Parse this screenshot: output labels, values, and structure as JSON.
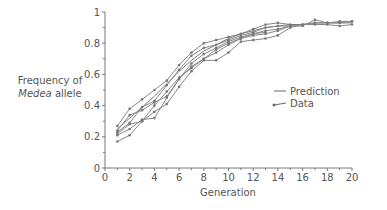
{
  "chart_data": {
    "type": "line",
    "title": "",
    "xlabel": "Generation",
    "ylabel": "Frequency of Medea allele",
    "ylabel_parts": {
      "line1": "Frequency of",
      "italic": "Medea",
      "rest": " allele"
    },
    "xlim": [
      0,
      20
    ],
    "ylim": [
      0,
      1
    ],
    "xticks": [
      0,
      2,
      4,
      6,
      8,
      10,
      12,
      14,
      16,
      18,
      20
    ],
    "yticks": [
      0,
      0.2,
      0.4,
      0.6,
      0.8,
      1
    ],
    "ytick_labels": [
      "0",
      "0.2",
      "0.4",
      "0.6",
      "0.8",
      "1"
    ],
    "grid": false,
    "legend": {
      "position": "right-middle",
      "entries": [
        {
          "label": "Prediction",
          "style": "line"
        },
        {
          "label": "Data",
          "style": "line-with-markers"
        }
      ]
    },
    "series": [
      {
        "name": "Prediction",
        "x": [
          1,
          2,
          3,
          4,
          5,
          6,
          7,
          8,
          9,
          10,
          11,
          12,
          13,
          14,
          15,
          16,
          17,
          18,
          19,
          20
        ],
        "values": [
          0.25,
          0.32,
          0.39,
          0.46,
          0.54,
          0.62,
          0.69,
          0.75,
          0.79,
          0.83,
          0.86,
          0.88,
          0.9,
          0.91,
          0.92,
          0.92,
          0.93,
          0.93,
          0.93,
          0.93
        ]
      },
      {
        "name": "Data 1",
        "x": [
          1,
          2,
          3,
          4,
          5,
          6,
          7,
          8,
          9,
          10,
          11,
          12,
          13,
          14,
          15
        ],
        "values": [
          0.27,
          0.38,
          0.44,
          0.5,
          0.56,
          0.66,
          0.74,
          0.8,
          0.82,
          0.84,
          0.86,
          0.89,
          0.92,
          0.93,
          0.92
        ]
      },
      {
        "name": "Data 2",
        "x": [
          1,
          2,
          3,
          4,
          5,
          6,
          7,
          8,
          9,
          10,
          11,
          12,
          13,
          14,
          15
        ],
        "values": [
          0.23,
          0.29,
          0.39,
          0.43,
          0.53,
          0.63,
          0.72,
          0.77,
          0.79,
          0.82,
          0.85,
          0.87,
          0.9,
          0.91,
          0.91
        ]
      },
      {
        "name": "Data 3",
        "x": [
          1,
          2,
          3,
          4,
          5,
          6,
          7,
          8,
          9,
          10,
          11,
          12,
          13,
          14,
          15,
          16,
          17,
          18,
          19,
          20
        ],
        "values": [
          0.21,
          0.25,
          0.31,
          0.32,
          0.45,
          0.57,
          0.65,
          0.7,
          0.76,
          0.8,
          0.83,
          0.85,
          0.86,
          0.88,
          0.91,
          0.91,
          0.95,
          0.93,
          0.94,
          0.94
        ]
      },
      {
        "name": "Data 4",
        "x": [
          1,
          2,
          3,
          4,
          5,
          6,
          7,
          8,
          9,
          10,
          11,
          12,
          13,
          14,
          15,
          16,
          17,
          18,
          19,
          20
        ],
        "values": [
          0.17,
          0.21,
          0.3,
          0.4,
          0.49,
          0.58,
          0.64,
          0.7,
          0.74,
          0.79,
          0.83,
          0.86,
          0.88,
          0.89,
          0.91,
          0.92,
          0.92,
          0.92,
          0.91,
          0.92
        ]
      },
      {
        "name": "Data 5",
        "x": [
          1,
          2,
          3,
          4,
          5,
          6,
          7,
          8,
          9,
          10,
          11,
          12,
          13
        ],
        "values": [
          0.24,
          0.34,
          0.37,
          0.42,
          0.46,
          0.57,
          0.67,
          0.73,
          0.77,
          0.81,
          0.84,
          0.86,
          0.87
        ]
      },
      {
        "name": "Data 6",
        "x": [
          1,
          2,
          3,
          4,
          5,
          6,
          7,
          8,
          9,
          10,
          11,
          12,
          13,
          14,
          15,
          16,
          17,
          18,
          19,
          20
        ],
        "values": [
          0.22,
          0.28,
          0.3,
          0.36,
          0.41,
          0.52,
          0.62,
          0.69,
          0.69,
          0.74,
          0.81,
          0.82,
          0.83,
          0.85,
          0.9,
          0.92,
          0.93,
          0.93,
          0.93,
          0.94
        ]
      }
    ]
  },
  "legend": {
    "prediction": "Prediction",
    "data": "Data"
  },
  "axes": {
    "xlabel": "Generation"
  }
}
